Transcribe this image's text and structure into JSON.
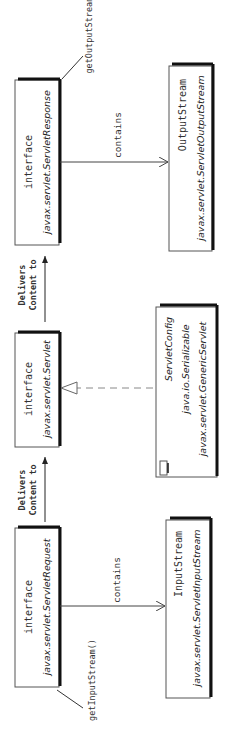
{
  "diagram": {
    "nodes": {
      "response": {
        "stereotype": "interface",
        "name": "javax.servlet.ServletResponse"
      },
      "output": {
        "stereotype": "OutputStream",
        "name": "javax.servlet.ServletOutputStream"
      },
      "servlet": {
        "stereotype": "interface",
        "name": "javax.servlet.Servlet"
      },
      "generic": {
        "line1": "ServletConfig",
        "line2": "java.io.Serializable",
        "line3": "javax.servlet.GenericServlet"
      },
      "request": {
        "stereotype": "interface",
        "name": "javax.servlet.ServletRequest"
      },
      "input": {
        "stereotype": "InputStream",
        "name": "javax.servlet.ServletInputStream"
      }
    },
    "edges": {
      "response_output": "contains",
      "response_note": "getOutputStream()",
      "servlet_response_1": "Delivers",
      "servlet_response_2": "Content to",
      "request_servlet_1": "Delivers",
      "request_servlet_2": "Content to",
      "request_input": "contains",
      "request_note": "getInputStream()"
    }
  }
}
